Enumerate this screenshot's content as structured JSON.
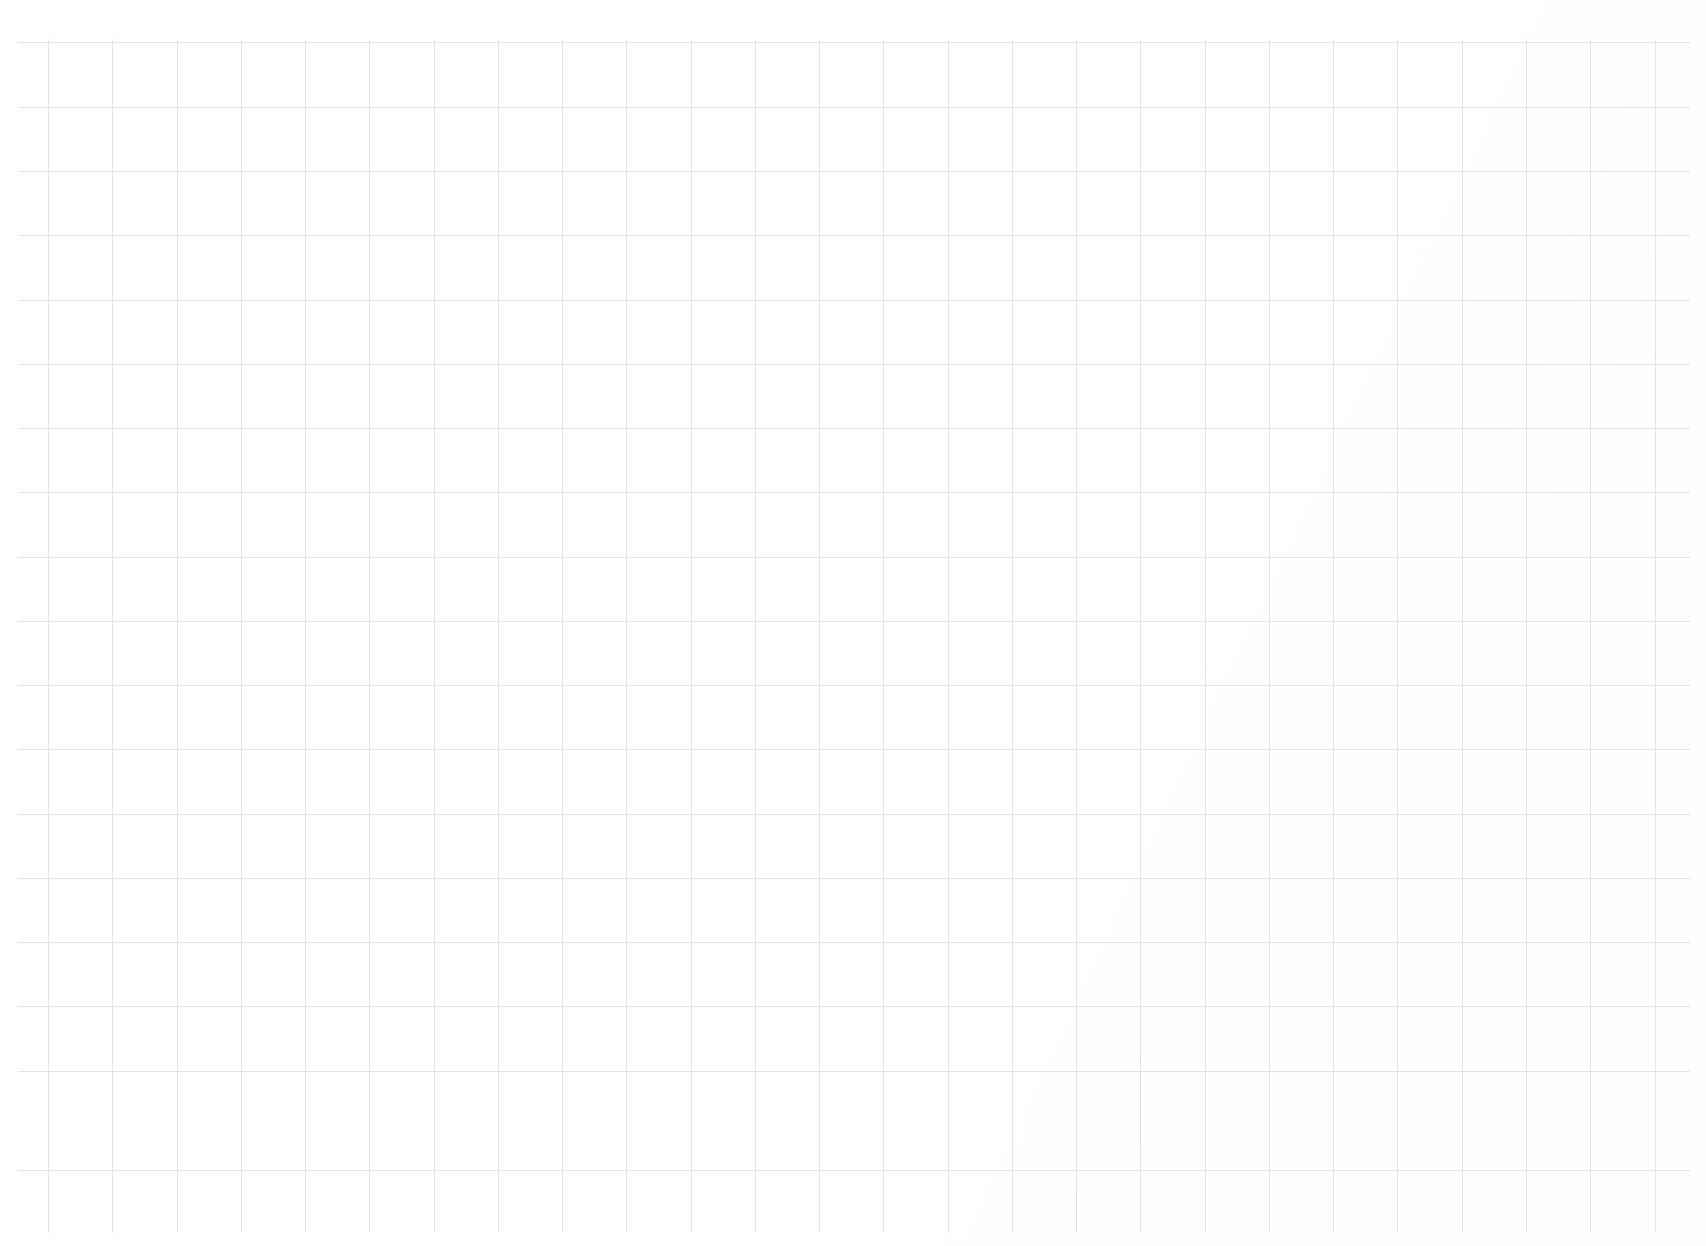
{
  "document": {
    "kind": "grid-paper",
    "title": "",
    "written_content": "",
    "page_width": 1706,
    "page_height": 1246
  },
  "colors": {
    "background": "#ffffff",
    "grid_line": "#e3e4e6",
    "ink": "#2b2b2b"
  },
  "grid": {
    "cell_size": 64,
    "line_width": 1,
    "horizontal_count": 18,
    "vertical_count": 26,
    "horizontal_extent": {
      "start_x": 18,
      "end_x": 1690
    },
    "vertical_extent": {
      "start_y": 39,
      "end_y": 1233
    },
    "horizontal_y": [
      42,
      107,
      171,
      235,
      300,
      364,
      428,
      492,
      557,
      621,
      685,
      749,
      814,
      878,
      942,
      1006,
      1071,
      1170
    ],
    "vertical_x": [
      48,
      112,
      177,
      241,
      305,
      369,
      434,
      498,
      562,
      626,
      691,
      755,
      819,
      883,
      948,
      1012,
      1076,
      1140,
      1205,
      1269,
      1333,
      1397,
      1462,
      1526,
      1590,
      1655
    ]
  }
}
